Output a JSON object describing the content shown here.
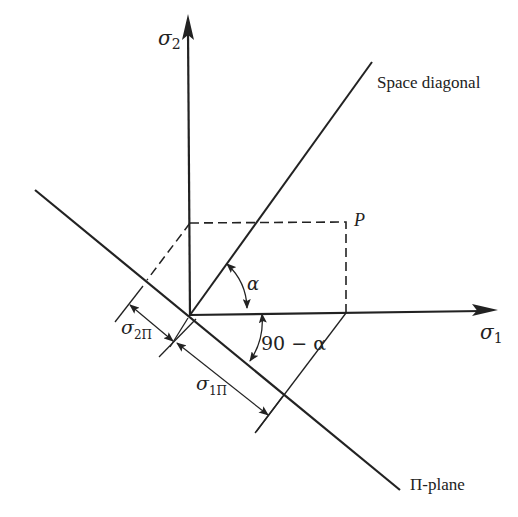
{
  "figure": {
    "type": "pi-plane-projection-diagram",
    "colors": {
      "background": "#ffffff",
      "ink": "#222222"
    },
    "labels": {
      "sigma2_axis": "σ",
      "sigma2_sub": "2",
      "sigma1_axis": "σ",
      "sigma1_sub": "1",
      "space_diagonal": "Space diagonal",
      "point_p": "P",
      "angle_alpha": "α",
      "angle_complement": "90 − α",
      "sigma2pi": "σ",
      "sigma2pi_sub": "2Π",
      "sigma1pi": "σ",
      "sigma1pi_sub": "1Π",
      "pi_plane": "Π-plane"
    },
    "elements": {
      "sigma2_axis": {
        "from": [
          190,
          315
        ],
        "to": [
          188,
          28
        ],
        "arrow": true
      },
      "sigma1_axis": {
        "from": [
          190,
          315
        ],
        "to": [
          497,
          310
        ],
        "arrow": true
      },
      "space_diagonal": {
        "from": [
          190,
          315
        ],
        "to": [
          370,
          63
        ]
      },
      "pi_plane": {
        "from": [
          35,
          190
        ],
        "to": [
          400,
          490
        ]
      },
      "point_p": [
        346,
        222
      ],
      "dashed_projection": [
        [
          190,
          223
        ],
        [
          346,
          222
        ],
        [
          346,
          313
        ]
      ]
    }
  }
}
